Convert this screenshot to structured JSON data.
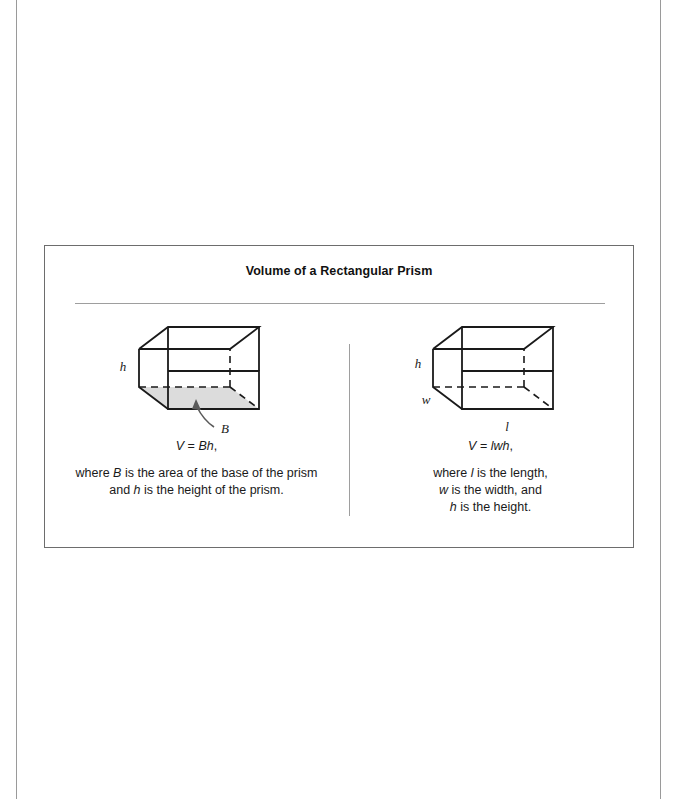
{
  "page": {
    "background": "#ffffff",
    "margin_rule_color": "#9a9a9a"
  },
  "panel": {
    "title": "Volume of a Rectangular Prism",
    "border_color": "#6d6d6d",
    "rule_color": "#9e9e9e",
    "divider_color": "#9e9e9e"
  },
  "columns": [
    {
      "id": "base-area-form",
      "figure": {
        "name": "rectangular-prism-with-shaded-base",
        "shaded_base": true,
        "base_fill": "#dcdcdc",
        "stroke": "#1a1a1a",
        "labels": [
          {
            "text": "h",
            "role": "height-edge"
          },
          {
            "text": "B",
            "role": "base-area-callout"
          }
        ],
        "callout_arrow": true
      },
      "formula": {
        "lhs": "V",
        "eq": " = ",
        "rhs": "Bh",
        "trailing": ","
      },
      "description_lines": [
        [
          {
            "t": "where ",
            "i": false
          },
          {
            "t": "B",
            "i": true
          },
          {
            "t": " is the area of the base of the prism",
            "i": false
          }
        ],
        [
          {
            "t": "and ",
            "i": false
          },
          {
            "t": "h",
            "i": true
          },
          {
            "t": " is the height of the prism.",
            "i": false
          }
        ]
      ]
    },
    {
      "id": "lwh-form",
      "figure": {
        "name": "rectangular-prism-with-dimensions",
        "shaded_base": false,
        "base_fill": "none",
        "stroke": "#1a1a1a",
        "labels": [
          {
            "text": "h",
            "role": "height-edge"
          },
          {
            "text": "w",
            "role": "width-edge"
          },
          {
            "text": "l",
            "role": "length-edge"
          }
        ],
        "callout_arrow": false
      },
      "formula": {
        "lhs": "V",
        "eq": " = ",
        "rhs": "lwh",
        "trailing": ","
      },
      "description_lines": [
        [
          {
            "t": "where ",
            "i": false
          },
          {
            "t": "l",
            "i": true
          },
          {
            "t": " is the length,",
            "i": false
          }
        ],
        [
          {
            "t": "w",
            "i": true
          },
          {
            "t": " is the width, and",
            "i": false
          }
        ],
        [
          {
            "t": "h",
            "i": true
          },
          {
            "t": " is the height.",
            "i": false
          }
        ]
      ]
    }
  ]
}
